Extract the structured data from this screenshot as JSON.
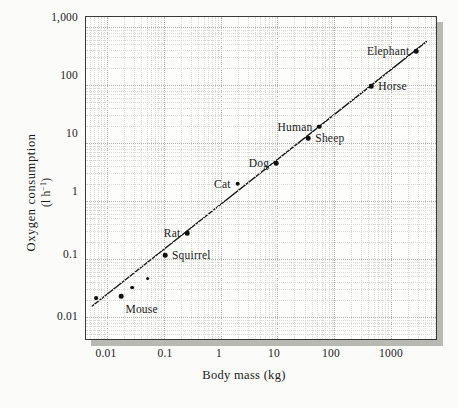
{
  "chart_data": {
    "type": "scatter",
    "title": "",
    "xlabel": "Body mass (kg)",
    "ylabel_line1": "Oxygen consumption",
    "ylabel_line2": "(l h−1)",
    "xscale": "log",
    "yscale": "log",
    "xlim": [
      0.004,
      5000
    ],
    "ylim": [
      0.008,
      1000
    ],
    "grid": true,
    "legend": "none",
    "xticks": [
      "0.01",
      "0.1",
      "1",
      "10",
      "100",
      "1000"
    ],
    "xtick_values": [
      0.01,
      0.1,
      1,
      10,
      100,
      1000
    ],
    "yticks": [
      "0.01",
      "0.1",
      "1",
      "10",
      "100",
      "1,000"
    ],
    "ytick_values": [
      0.01,
      0.1,
      1,
      10,
      100,
      1000
    ],
    "series": [
      {
        "name": "Oxygen consumption vs body mass",
        "points": [
          {
            "label": "",
            "x": 0.0065,
            "y": 0.021,
            "label_pos": "none"
          },
          {
            "label": "Mouse",
            "x": 0.018,
            "y": 0.023,
            "label_pos": "below"
          },
          {
            "label": "",
            "x": 0.028,
            "y": 0.032,
            "label_pos": "none"
          },
          {
            "label": "",
            "x": 0.052,
            "y": 0.046,
            "label_pos": "none"
          },
          {
            "label": "Squirrel",
            "x": 0.105,
            "y": 0.115,
            "label_pos": "right"
          },
          {
            "label": "Rat",
            "x": 0.26,
            "y": 0.28,
            "label_pos": "left"
          },
          {
            "label": "Cat",
            "x": 2.0,
            "y": 2.0,
            "label_pos": "left"
          },
          {
            "label": "Dog",
            "x": 9.5,
            "y": 4.5,
            "label_pos": "left"
          },
          {
            "label": "Sheep",
            "x": 35.0,
            "y": 12.0,
            "label_pos": "right"
          },
          {
            "label": "Human",
            "x": 55.0,
            "y": 19.0,
            "label_pos": "left"
          },
          {
            "label": "Horse",
            "x": 450.0,
            "y": 95.0,
            "label_pos": "right"
          },
          {
            "label": "Elephant",
            "x": 2800.0,
            "y": 380.0,
            "label_pos": "left"
          }
        ]
      }
    ],
    "fit_line": {
      "type": "linear-on-log-log",
      "description": "allometric scaling regression line",
      "x_start": 0.0055,
      "y_start": 0.0155,
      "x_end": 4200,
      "y_end": 560
    },
    "colors": {
      "marker": "#111111",
      "line": "#1a1a1a",
      "grid": "#b0b0ab",
      "frame": "#3a3a3a",
      "background": "#fbfbf9",
      "plot_background": "#fdfdfb",
      "shadow": "#b9b9b4"
    }
  },
  "axes": {
    "y_label_line1": "Oxygen consumption",
    "y_label_line2_prefix": "(l h",
    "y_label_line2_sup": "−1",
    "y_label_line2_suffix": ")",
    "x_label": "Body mass (kg)"
  }
}
